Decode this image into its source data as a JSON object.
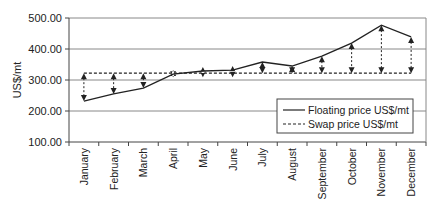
{
  "chart_data": {
    "type": "line",
    "title": "",
    "xlabel": "",
    "ylabel": "US$/mt",
    "ylim": [
      100,
      500
    ],
    "yticks": [
      "100.00",
      "200.00",
      "300.00",
      "400.00",
      "500.00"
    ],
    "grid": true,
    "legend_position": "lower right",
    "categories": [
      "January",
      "February",
      "March",
      "April",
      "May",
      "June",
      "July",
      "August",
      "September",
      "October",
      "November",
      "December"
    ],
    "series": [
      {
        "name": "Floating price US$/mt",
        "style": "solid",
        "values": [
          232,
          255,
          274,
          319,
          329,
          332,
          358,
          345,
          377,
          419,
          477,
          439
        ]
      },
      {
        "name": "Swap price US$/mt",
        "style": "dashed",
        "values": [
          322,
          322,
          322,
          322,
          322,
          322,
          322,
          322,
          322,
          322,
          322,
          322
        ]
      }
    ],
    "annotations": "Dotted double-headed arrows connect floating price and swap price at each month"
  },
  "axis": {
    "y_label": "US$/mt"
  },
  "legend": {
    "items": [
      {
        "label": "Floating price US$/mt",
        "style": "solid"
      },
      {
        "label": "Swap price US$/mt",
        "style": "dashed"
      }
    ]
  },
  "colors": {
    "line": "#222222",
    "grid": "#888888",
    "axis": "#444444"
  }
}
